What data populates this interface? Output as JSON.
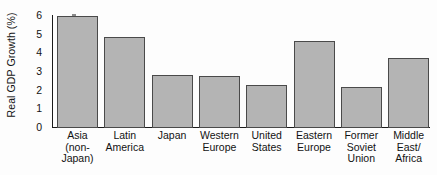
{
  "chart_data": {
    "type": "bar",
    "title": "",
    "xlabel": "",
    "ylabel": "Real GDP Growth (%)",
    "ylim": [
      0,
      6
    ],
    "ytick_labels": [
      "6",
      "5",
      "4",
      "3",
      "2",
      "1",
      "0"
    ],
    "ytick_values": [
      6,
      5,
      4,
      3,
      2,
      1,
      0
    ],
    "grid": false,
    "legend": "none",
    "bar_color": "#b4b4b4",
    "bar_edge_color": "#4a4a4a",
    "axis_color": "#1a1a1a",
    "background_color": "#fdfdfd",
    "categories": [
      "Asia (non-Japan)",
      "Latin America",
      "Japan",
      "Western Europe",
      "United States",
      "Eastern Europe",
      "Former Soviet Union",
      "Middle East/Africa"
    ],
    "category_label_lines": [
      [
        "Asia",
        "(non-",
        "Japan)"
      ],
      [
        "Latin",
        "America"
      ],
      [
        "Japan"
      ],
      [
        "Western",
        "Europe"
      ],
      [
        "United",
        "States"
      ],
      [
        "Eastern",
        "Europe"
      ],
      [
        "Former",
        "Soviet",
        "Union"
      ],
      [
        "Middle",
        "East/",
        "Africa"
      ]
    ],
    "values": [
      6.0,
      4.85,
      2.82,
      2.78,
      2.3,
      4.65,
      2.2,
      3.75
    ]
  }
}
